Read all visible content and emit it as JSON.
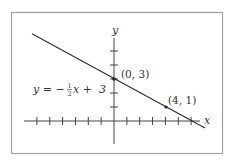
{
  "chart_data": {
    "type": "line",
    "title": "",
    "xlabel": "x",
    "ylabel": "y",
    "grid": false,
    "x_ticks": [
      -6,
      -5,
      -4,
      -3,
      -2,
      -1,
      1,
      2,
      3,
      4,
      5,
      6
    ],
    "y_ticks": [
      1,
      2,
      3,
      4,
      5
    ],
    "equation_label": "y = −½x + 3",
    "series": [
      {
        "name": "y = -1/2 x + 3",
        "slope": -0.5,
        "intercept": 3,
        "x_range": [
          -6.4,
          7
        ]
      }
    ],
    "points": [
      {
        "x": 0,
        "y": 3,
        "label": "(0, 3)"
      },
      {
        "x": 4,
        "y": 1,
        "label": "(4, 1)"
      }
    ]
  },
  "labels": {
    "x_axis": "x",
    "y_axis": "y",
    "eq_prefix": "y = −",
    "eq_num": "1",
    "eq_den": "2",
    "eq_suffix": "x +  3",
    "point1": "(0, 3)",
    "point2": "(4, 1)"
  },
  "colors": {
    "line": "#333333",
    "axis": "#444444",
    "frame": "#9a9a9a"
  }
}
